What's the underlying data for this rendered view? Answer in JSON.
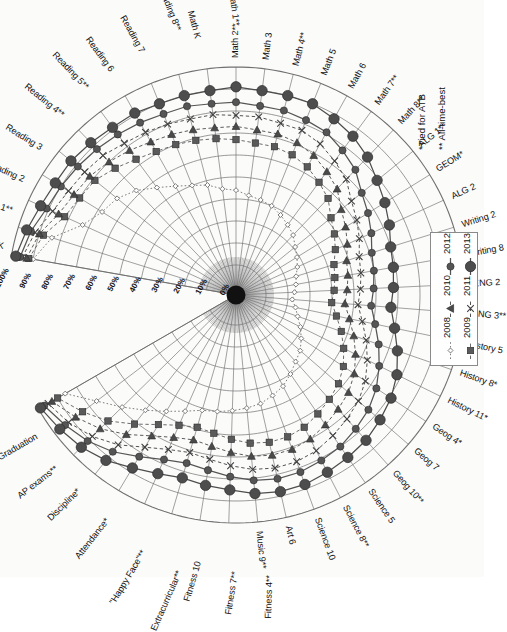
{
  "chart_data": {
    "type": "radar",
    "title": "",
    "subtitle": "",
    "xlabel": "",
    "ylabel": "",
    "rlim": [
      0,
      100
    ],
    "r_tick_labels": [
      "0%",
      "10%",
      "20%",
      "30%",
      "40%",
      "50%",
      "60%",
      "70%",
      "80%",
      "90%",
      "100%"
    ],
    "r_ticks": [
      0,
      10,
      20,
      30,
      40,
      50,
      60,
      70,
      80,
      90,
      100
    ],
    "grid": true,
    "legend_position": "right",
    "rotation_deg": -90,
    "categories": [
      "Reading K",
      "Reading 1**",
      "Reading 2",
      "Reading 3",
      "Reading 4**",
      "Reading 5**",
      "Reading 6",
      "Reading 7",
      "Reading 8**",
      "Math K",
      "Math 1**",
      "Math 2**",
      "Math 3",
      "Math 4**",
      "Math 5",
      "Math 6",
      "Math 7**",
      "Math 8**",
      "ALG 1**",
      "GEOM*",
      "ALG 2",
      "Writing 2",
      "Writing 8",
      "ENG 2",
      "ENG 3**",
      "History 5",
      "History 8*",
      "History 11*",
      "Geog 4*",
      "Geog 7",
      "Geog 10**",
      "Science 5",
      "Science 8**",
      "Science 10",
      "Art 6",
      "Music 9**",
      "Fitness 4**",
      "Fitness 7**",
      "Fitness 10",
      "Extracurricular**",
      "\"Happy Face\"**",
      "Attendance*",
      "Discipline*",
      "AP exams**",
      "Graduation"
    ],
    "series": [
      {
        "name": "2008",
        "color": "#6f6f6f",
        "marker": "small-diamond",
        "line": "dotted",
        "values": [
          90,
          84,
          73,
          68,
          66,
          62,
          57,
          53,
          50,
          48,
          45,
          44,
          42,
          41,
          40,
          38,
          36,
          34,
          31,
          29,
          27,
          25,
          24,
          23,
          22,
          24,
          26,
          29,
          32,
          35,
          37,
          40,
          43,
          45,
          47,
          48,
          49,
          50,
          51,
          54,
          58,
          63,
          69,
          76,
          86
        ]
      },
      {
        "name": "2009",
        "color": "#5a5a5a",
        "marker": "square",
        "line": "dashed",
        "values": [
          92,
          88,
          82,
          80,
          79,
          76,
          73,
          71,
          70,
          69,
          68,
          67,
          66,
          66,
          65,
          63,
          60,
          57,
          52,
          49,
          46,
          43,
          42,
          41,
          40,
          43,
          47,
          51,
          55,
          58,
          60,
          62,
          64,
          65,
          65,
          64,
          62,
          60,
          59,
          61,
          65,
          71,
          78,
          84,
          90
        ]
      },
      {
        "name": "2010",
        "color": "#4a4a4a",
        "marker": "triangle",
        "line": "dashed",
        "values": [
          93,
          90,
          85,
          83,
          82,
          80,
          78,
          76,
          75,
          74,
          73,
          73,
          72,
          72,
          71,
          69,
          66,
          63,
          58,
          55,
          52,
          49,
          48,
          47,
          46,
          49,
          53,
          57,
          61,
          64,
          66,
          68,
          70,
          71,
          71,
          70,
          68,
          66,
          65,
          67,
          71,
          77,
          83,
          88,
          93
        ]
      },
      {
        "name": "2011",
        "color": "#3f3f3f",
        "marker": "x",
        "line": "dashed",
        "values": [
          95,
          92,
          88,
          86,
          85,
          84,
          82,
          81,
          80,
          79,
          79,
          78,
          78,
          77,
          77,
          75,
          72,
          69,
          64,
          61,
          58,
          55,
          54,
          53,
          52,
          55,
          59,
          63,
          67,
          70,
          72,
          74,
          76,
          77,
          77,
          76,
          74,
          72,
          71,
          73,
          77,
          83,
          88,
          92,
          95
        ]
      },
      {
        "name": "2012",
        "color": "#555555",
        "marker": "medium-circle",
        "line": "solid",
        "values": [
          96,
          94,
          91,
          90,
          89,
          88,
          87,
          86,
          85,
          85,
          84,
          84,
          83,
          83,
          82,
          81,
          78,
          75,
          70,
          67,
          64,
          61,
          60,
          59,
          58,
          61,
          65,
          69,
          73,
          76,
          78,
          80,
          81,
          82,
          82,
          81,
          79,
          77,
          76,
          78,
          82,
          87,
          91,
          94,
          97
        ]
      },
      {
        "name": "2013",
        "color": "#4d4d4d",
        "marker": "large-circle",
        "line": "solid",
        "values": [
          98,
          96,
          94,
          93,
          93,
          92,
          91,
          91,
          90,
          90,
          90,
          91,
          90,
          90,
          90,
          88,
          86,
          83,
          79,
          76,
          73,
          70,
          69,
          68,
          67,
          70,
          74,
          78,
          81,
          83,
          85,
          86,
          87,
          88,
          88,
          87,
          85,
          84,
          83,
          85,
          88,
          92,
          95,
          97,
          99
        ]
      }
    ],
    "annotations": [
      "*Tied for ATB",
      "** All-time-best"
    ]
  },
  "footnotes": {
    "tied": "*Tied for ATB",
    "atb": "** All-time-best"
  },
  "legend": {
    "entries": [
      {
        "label": "2008",
        "marker": "small-diamond"
      },
      {
        "label": "2009",
        "marker": "square"
      },
      {
        "label": "2010",
        "marker": "triangle"
      },
      {
        "label": "2011",
        "marker": "x"
      },
      {
        "label": "2012",
        "marker": "medium-circle"
      },
      {
        "label": "2013",
        "marker": "large-circle"
      }
    ]
  },
  "colors": {
    "grid": "#707070",
    "hub": "#111111",
    "text": "#111111",
    "page": "#fbfbfa"
  }
}
